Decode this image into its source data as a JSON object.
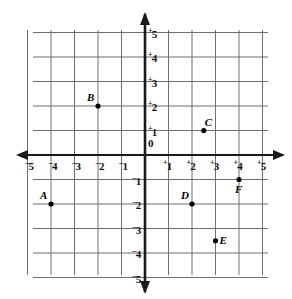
{
  "chart_data": {
    "type": "scatter",
    "title": "",
    "xlabel": "",
    "ylabel": "",
    "xlim": [
      -5,
      5
    ],
    "ylim": [
      -5,
      5
    ],
    "grid": true,
    "legend": "none",
    "x_ticks": [
      -5,
      -4,
      -3,
      -2,
      -1,
      1,
      2,
      3,
      4,
      5
    ],
    "y_ticks": [
      5,
      4,
      3,
      2,
      1,
      0,
      -1,
      -2,
      -3,
      -4,
      -5
    ],
    "x_tick_labels": [
      "⁻5",
      "⁻4",
      "⁻3",
      "⁻2",
      "⁻1",
      "⁺1",
      "⁺2",
      "⁺3",
      "⁺4",
      "⁺5"
    ],
    "y_tick_labels": [
      "⁺5",
      "⁺4",
      "⁺3",
      "⁺2",
      "⁺1",
      "0",
      "⁻1",
      "⁻2",
      "⁻3",
      "⁻4",
      "⁻5"
    ],
    "points": [
      {
        "label": "A",
        "x": -4,
        "y": -2,
        "label_position": "upper-left"
      },
      {
        "label": "B",
        "x": -2,
        "y": 2,
        "label_position": "upper-left"
      },
      {
        "label": "C",
        "x": 2.5,
        "y": 1,
        "label_position": "upper-right"
      },
      {
        "label": "D",
        "x": 2,
        "y": -2,
        "label_position": "upper-left"
      },
      {
        "label": "E",
        "x": 3,
        "y": -3.5,
        "label_position": "right"
      },
      {
        "label": "F",
        "x": 4,
        "y": -1,
        "label_position": "lower-left"
      }
    ]
  },
  "axis_ticks": {
    "x_positive": [
      {
        "sign": "+",
        "value": "1"
      },
      {
        "sign": "+",
        "value": "2"
      },
      {
        "sign": "+",
        "value": "3"
      },
      {
        "sign": "+",
        "value": "4"
      },
      {
        "sign": "+",
        "value": "5"
      }
    ],
    "x_negative": [
      {
        "sign": "–",
        "value": "5"
      },
      {
        "sign": "–",
        "value": "4"
      },
      {
        "sign": "–",
        "value": "3"
      },
      {
        "sign": "–",
        "value": "2"
      },
      {
        "sign": "–",
        "value": "1"
      }
    ],
    "y_positive": [
      {
        "sign": "+",
        "value": "5"
      },
      {
        "sign": "+",
        "value": "4"
      },
      {
        "sign": "+",
        "value": "3"
      },
      {
        "sign": "+",
        "value": "2"
      },
      {
        "sign": "+",
        "value": "1"
      }
    ],
    "origin": {
      "sign": "",
      "value": "0"
    },
    "y_negative": [
      {
        "sign": "–",
        "value": "1"
      },
      {
        "sign": "–",
        "value": "2"
      },
      {
        "sign": "–",
        "value": "3"
      },
      {
        "sign": "–",
        "value": "4"
      },
      {
        "sign": "–",
        "value": "5"
      }
    ]
  },
  "colors": {
    "background": "#ffffff",
    "grid_line": "#6e6e6e",
    "axis_line": "#1a1a1a",
    "point_fill": "#000000",
    "text": "#111111"
  },
  "geometry": {
    "origin_x": 145,
    "origin_y": 155,
    "cell_width": 23.5,
    "cell_height": 24.5,
    "grid_left": 33,
    "grid_right": 268,
    "grid_top": 30,
    "grid_bottom": 275
  }
}
